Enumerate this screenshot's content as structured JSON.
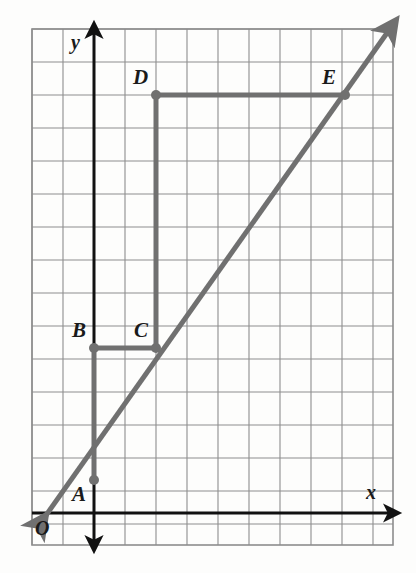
{
  "figure": {
    "kind": "coordinate-grid-geometry-figure",
    "background_color": "#fdfdfc",
    "grid_color": "#8d8d8d",
    "axis_color": "#111111",
    "figure_color": "#707070",
    "label_color": "#1a1a1a"
  },
  "axes": {
    "x_label": "x",
    "y_label": "y",
    "origin_label": "O",
    "x_axis_pixel_y": 513,
    "y_axis_pixel_x": 94,
    "x_arrow_direction": "right",
    "y_arrow_direction": "up"
  },
  "grid": {
    "left": 32,
    "top": 29,
    "right": 393,
    "bottom": 545,
    "cell_width": 31,
    "cell_height": 33,
    "columns": 11,
    "rows": 16
  },
  "points": [
    {
      "label": "A",
      "px": 94,
      "py": 480,
      "label_px": 72,
      "label_py": 484,
      "unit_x": 0,
      "unit_y": 1
    },
    {
      "label": "B",
      "px": 94,
      "py": 348,
      "label_px": 72,
      "label_py": 320,
      "unit_x": 0,
      "unit_y": 5
    },
    {
      "label": "C",
      "px": 156,
      "py": 348,
      "label_px": 134,
      "label_py": 320,
      "unit_x": 2,
      "unit_y": 5
    },
    {
      "label": "D",
      "px": 156,
      "py": 95,
      "label_px": 134,
      "label_py": 66,
      "unit_x": 2,
      "unit_y": 12.67
    },
    {
      "label": "E",
      "px": 345,
      "py": 95,
      "label_px": 322,
      "label_py": 66,
      "unit_x": 8.1,
      "unit_y": 12.67
    }
  ],
  "segments": [
    {
      "name": "segment-A-B",
      "from": "A",
      "to": "B",
      "orientation": "vertical"
    },
    {
      "name": "segment-B-C",
      "from": "B",
      "to": "C",
      "orientation": "horizontal"
    },
    {
      "name": "segment-C-D",
      "from": "C",
      "to": "D",
      "orientation": "vertical"
    },
    {
      "name": "segment-D-E",
      "from": "D",
      "to": "E",
      "orientation": "horizontal"
    }
  ],
  "line": {
    "name": "diagonal-line-through-A-C-E",
    "passes_through": [
      "A",
      "C",
      "E"
    ],
    "arrow_start_px": 37,
    "arrow_start_py": 528,
    "arrow_end_px": 387,
    "arrow_end_py": 33,
    "double_arrow": true
  },
  "chart_data": {
    "type": "scatter",
    "title": "",
    "xlabel": "x",
    "ylabel": "y",
    "grid": true,
    "legend": false,
    "points": [
      {
        "name": "A",
        "x": 0,
        "y": 1
      },
      {
        "name": "B",
        "x": 0,
        "y": 5
      },
      {
        "name": "C",
        "x": 2,
        "y": 5
      },
      {
        "name": "D",
        "x": 2,
        "y": 13
      },
      {
        "name": "E",
        "x": 8,
        "y": 13
      }
    ],
    "series": [
      {
        "name": "staircase-path",
        "type": "line",
        "points": [
          [
            0,
            1
          ],
          [
            0,
            5
          ],
          [
            2,
            5
          ],
          [
            2,
            13
          ],
          [
            8,
            13
          ]
        ]
      },
      {
        "name": "diagonal-ray",
        "type": "line",
        "points": [
          [
            -0.5,
            0.5
          ],
          [
            9.5,
            14.5
          ]
        ],
        "through": [
          "A",
          "C",
          "E"
        ],
        "arrows": "both"
      }
    ]
  }
}
